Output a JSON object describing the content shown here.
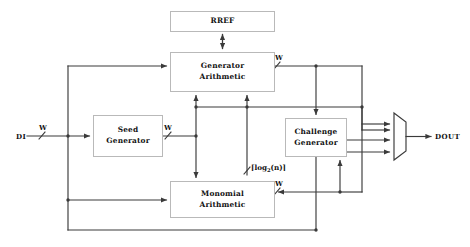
{
  "diagram": {
    "blocks": [
      {
        "id": "rref",
        "label": "RREF",
        "lines": [
          "RREF"
        ]
      },
      {
        "id": "generator",
        "label": "Generator Arithmetic",
        "lines": [
          "Generator",
          "Arithmetic"
        ]
      },
      {
        "id": "seed",
        "label": "Seed Generator",
        "lines": [
          "Seed",
          "Generator"
        ]
      },
      {
        "id": "challenge",
        "label": "Challenge Generator",
        "lines": [
          "Challenge",
          "Generator"
        ]
      },
      {
        "id": "monomial",
        "label": "Monomial Arithmetic",
        "lines": [
          "Monomial",
          "Arithmetic"
        ]
      },
      {
        "id": "mux",
        "label": "Output Multiplexer",
        "lines": []
      }
    ],
    "ports": {
      "input": "DI",
      "output": "DOUT"
    },
    "bus_labels": {
      "di_width": "W",
      "seed_out_width": "W",
      "generator_out_width": "W",
      "monomial_out_width": "W",
      "log_width_prefix": "⌈log",
      "log_width_sub": "2",
      "log_width_suffix": "(n)⌉"
    },
    "colors": {
      "background": "#ffffff",
      "box_border": "#b9b9b9",
      "wire": "#3a3a3a",
      "text": "#121212"
    }
  }
}
